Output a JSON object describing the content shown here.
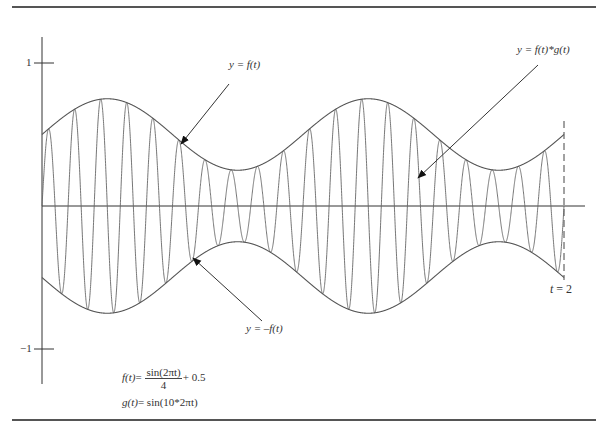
{
  "figure": {
    "type": "diagram"
  },
  "axes": {
    "y_ticks": [
      {
        "value": 1,
        "label": "1"
      },
      {
        "value": -1,
        "label": "−1"
      }
    ],
    "t_end_label": "t = 2",
    "t_end_var": "t",
    "t_end_eq": " = 2",
    "t_range": [
      0,
      2
    ],
    "y_range": [
      -1,
      1
    ]
  },
  "labels": {
    "envelope_upper": {
      "prefix": "y = ",
      "func": "f(t)"
    },
    "envelope_lower": {
      "prefix": "y = –",
      "func": "f(t)"
    },
    "product": {
      "prefix": "y = ",
      "func": "f(t)*g(t)"
    }
  },
  "formulas": {
    "f_lhs": "f(t)",
    "f_eq": "= ",
    "f_num": "sin(2πt)",
    "f_den": "4",
    "f_tail": "+ 0.5",
    "g_lhs": "g(t)",
    "g_rhs": "= sin(10*2πt)"
  },
  "functions": {
    "f": {
      "amplitude": 0.25,
      "frequency": 1,
      "offset": 0.5
    },
    "g": {
      "frequency": 10
    }
  },
  "colors": {
    "curve": "#555555",
    "axis": "#333333",
    "arrow": "#111111",
    "rule": "#555555"
  }
}
